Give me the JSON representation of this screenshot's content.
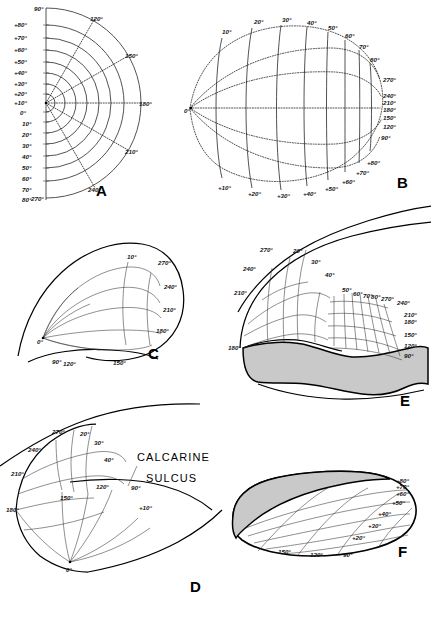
{
  "figure": {
    "background_color": "#ffffff",
    "ink_color": "#1a1a1a",
    "shade_color": "#c9c9c9"
  },
  "annotations": {
    "calcarine_line1": "CALCARINE",
    "calcarine_line2": "SULCUS"
  },
  "panels": [
    {
      "id": "A",
      "letter": "A",
      "kind": "polar-grid",
      "description": "Polar coordinate chart of the visual field, right half-plane",
      "eccentricity_labels_upper": [
        "+80°",
        "+70°",
        "+60°",
        "+50°",
        "+40°",
        "+30°",
        "+20°",
        "+10°"
      ],
      "origin_label": "0°",
      "eccentricity_labels_lower": [
        "10°",
        "20°",
        "30°",
        "40°",
        "50°",
        "60°",
        "70°",
        "80°"
      ],
      "meridian_labels": [
        "90°",
        "120°",
        "150°",
        "180°",
        "210°",
        "240°",
        "270°"
      ]
    },
    {
      "id": "B",
      "letter": "B",
      "kind": "flat-map",
      "description": "Flattened map of the visual field representation",
      "origin_label": "0°",
      "top_labels": [
        "10°",
        "20°",
        "30°",
        "40°",
        "50°",
        "60°",
        "70°",
        "80°"
      ],
      "bottom_labels": [
        "+10°",
        "+20°",
        "+30°",
        "+40°",
        "+50°",
        "+60°",
        "+70°",
        "+80°"
      ],
      "right_labels": [
        "270°",
        "240°",
        "210°",
        "180°",
        "150°",
        "120°",
        "90°"
      ]
    },
    {
      "id": "C",
      "letter": "C",
      "kind": "cortex-lateral",
      "description": "Grid mapped onto the rounded occipital pole",
      "origin_label": "0°",
      "inner_label": "10°",
      "right_labels": [
        "270°",
        "240°",
        "210°",
        "180°"
      ],
      "bottom_labels": [
        "90°",
        "120°",
        "150°"
      ]
    },
    {
      "id": "D",
      "letter": "D",
      "kind": "cortex-medial",
      "description": "Medial view with calcarine sulcus indicated",
      "left_labels": [
        "270°",
        "240°",
        "210°",
        "180°"
      ],
      "upper_labels": [
        "20°",
        "30°",
        "40°"
      ],
      "mid_labels": [
        "150°",
        "120°",
        "90°"
      ],
      "small_label": "+10°",
      "origin_label": "0°"
    },
    {
      "id": "E",
      "letter": "E",
      "kind": "cortex-opened",
      "description": "Opened calcarine sulcus, shaded lower bank",
      "left_labels": [
        "270°",
        "240°",
        "210°",
        "180°"
      ],
      "upper_labels": [
        "20°",
        "30°",
        "40°",
        "50°",
        "60°",
        "70°",
        "80°"
      ],
      "right_labels": [
        "270°",
        "240°",
        "210°",
        "180°",
        "150°",
        "120°",
        "90°"
      ]
    },
    {
      "id": "F",
      "letter": "F",
      "kind": "cortex-detail",
      "description": "Detail of the lower bank with shaded strip",
      "right_labels": [
        "+80°",
        "+70°",
        "+60°",
        "+50°",
        "+40°",
        "+30°",
        "+20°"
      ],
      "bottom_labels": [
        "150°",
        "120°",
        "90°"
      ]
    }
  ]
}
